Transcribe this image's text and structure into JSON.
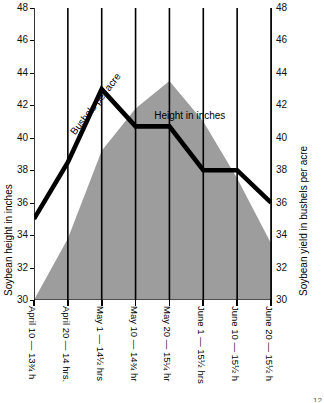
{
  "chart_data": {
    "type": "area",
    "title": "",
    "xlabel": "",
    "ylabel": "Soybean height in inches",
    "y2label": "Soybean yield in bushels per acre",
    "ylim": [
      30,
      48
    ],
    "y2lim": [
      30,
      48
    ],
    "grid": true,
    "legend": "inline-annotations",
    "yticks": [
      30,
      32,
      34,
      36,
      38,
      40,
      42,
      44,
      46,
      48
    ],
    "y2ticks": [
      30,
      32,
      34,
      36,
      38,
      40,
      42,
      44,
      46,
      48
    ],
    "categories": [
      "April 10 — 13¾ h",
      "April 20 — 14 hrs.",
      "May 1 — 14½ hrs",
      "May 10 — 14¾ hr",
      "May 20 — 15¼ hr",
      "June 1 — 15½ hrs",
      "June 10 — 15½ h",
      "June 20 — 15½ h"
    ],
    "series": [
      {
        "name": "Height in inches",
        "render": "area",
        "color": "#9d9d9d",
        "values": [
          30.0,
          33.8,
          39.2,
          41.8,
          43.5,
          41.0,
          37.5,
          33.5
        ]
      },
      {
        "name": "Bushels per acre",
        "render": "line",
        "color": "#000000",
        "values": [
          35.0,
          38.5,
          43.0,
          40.7,
          40.7,
          38.0,
          38.0,
          36.0
        ]
      }
    ],
    "annotations": [
      {
        "text": "Bushels per acre",
        "x": 1.0,
        "y": 40.5,
        "rotation": -52
      },
      {
        "text": "Height in inches",
        "x": 3.55,
        "y": 41.7,
        "rotation": 0
      }
    ]
  },
  "corner": {
    "mark": "12"
  }
}
